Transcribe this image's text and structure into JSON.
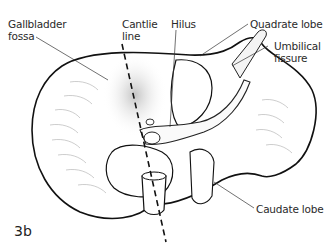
{
  "figure": {
    "id": "3b",
    "labels": {
      "gallbladder_fossa_line1": "Gallbladder",
      "gallbladder_fossa_line2": "fossa",
      "cantlie_line1": "Cantlie",
      "cantlie_line2": "line",
      "hilus": "Hilus",
      "quadrate_lobe": "Quadrate lobe",
      "umbilical_fissure_line1": "Umbilical",
      "umbilical_fissure_line2": "fissure",
      "caudate_lobe": "Caudate lobe"
    }
  }
}
